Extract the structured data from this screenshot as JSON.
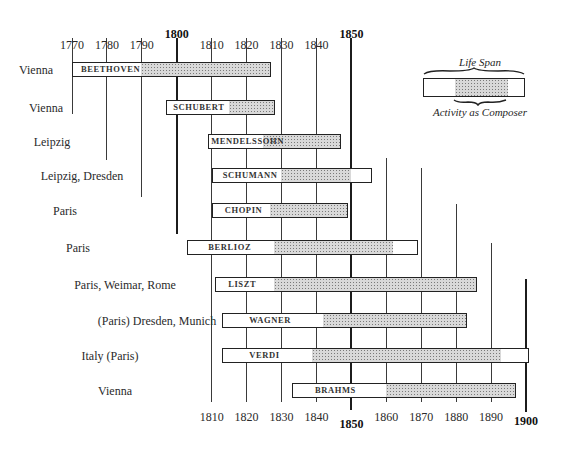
{
  "chart_data": {
    "type": "timeline",
    "title": "",
    "xlabel": "",
    "ylabel": "",
    "x_range": [
      1770,
      1900
    ],
    "grid": true,
    "top_ticks": [
      {
        "year": 1770,
        "label": "1770",
        "major": false
      },
      {
        "year": 1780,
        "label": "1780",
        "major": false
      },
      {
        "year": 1790,
        "label": "1790",
        "major": false
      },
      {
        "year": 1800,
        "label": "1800",
        "major": true
      },
      {
        "year": 1810,
        "label": "1810",
        "major": false
      },
      {
        "year": 1820,
        "label": "1820",
        "major": false
      },
      {
        "year": 1830,
        "label": "1830",
        "major": false
      },
      {
        "year": 1840,
        "label": "1840",
        "major": false
      },
      {
        "year": 1850,
        "label": "1850",
        "major": true
      }
    ],
    "bottom_ticks": [
      {
        "year": 1810,
        "label": "1810",
        "major": false
      },
      {
        "year": 1820,
        "label": "1820",
        "major": false
      },
      {
        "year": 1830,
        "label": "1830",
        "major": false
      },
      {
        "year": 1840,
        "label": "1840",
        "major": false
      },
      {
        "year": 1850,
        "label": "1850",
        "major": true
      },
      {
        "year": 1860,
        "label": "1860",
        "major": false
      },
      {
        "year": 1870,
        "label": "1870",
        "major": false
      },
      {
        "year": 1880,
        "label": "1880",
        "major": false
      },
      {
        "year": 1890,
        "label": "1890",
        "major": false
      },
      {
        "year": 1900,
        "label": "1900",
        "major": true
      }
    ],
    "composers": [
      {
        "name": "BEETHOVEN",
        "city": "Vienna",
        "born": 1770,
        "died": 1827,
        "active_start": 1790,
        "active_end": 1827
      },
      {
        "name": "SCHUBERT",
        "city": "Vienna",
        "born": 1797,
        "died": 1828,
        "active_start": 1815,
        "active_end": 1828
      },
      {
        "name": "MENDELSSOHN",
        "city": "Leipzig",
        "born": 1809,
        "died": 1847,
        "active_start": 1825,
        "active_end": 1847
      },
      {
        "name": "SCHUMANN",
        "city": "Leipzig, Dresden",
        "born": 1810,
        "died": 1856,
        "active_start": 1830,
        "active_end": 1850
      },
      {
        "name": "CHOPIN",
        "city": "Paris",
        "born": 1810,
        "died": 1849,
        "active_start": 1827,
        "active_end": 1849
      },
      {
        "name": "BERLIOZ",
        "city": "Paris",
        "born": 1803,
        "died": 1869,
        "active_start": 1828,
        "active_end": 1862
      },
      {
        "name": "LISZT",
        "city": "Paris, Weimar, Rome",
        "born": 1811,
        "died": 1886,
        "active_start": 1828,
        "active_end": 1886
      },
      {
        "name": "WAGNER",
        "city": "(Paris) Dresden, Munich",
        "born": 1813,
        "died": 1883,
        "active_start": 1842,
        "active_end": 1883
      },
      {
        "name": "VERDI",
        "city": "Italy (Paris)",
        "born": 1813,
        "died": 1901,
        "active_start": 1839,
        "active_end": 1893
      },
      {
        "name": "BRAHMS",
        "city": "Vienna",
        "born": 1833,
        "died": 1897,
        "active_start": 1860,
        "active_end": 1897
      }
    ],
    "legend": {
      "top_label": "Life Span",
      "bottom_label": "Activity as Composer",
      "position": "top-right"
    }
  }
}
